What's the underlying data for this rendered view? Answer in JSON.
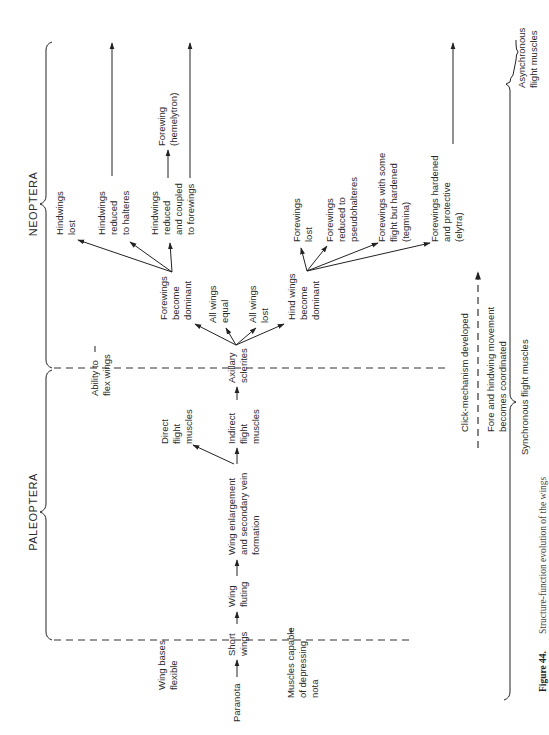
{
  "groups": {
    "neoptera": "NEOPTERA",
    "paleoptera": "PALEOPTERA",
    "synchronous": "Synchronous flight muscles",
    "asynchronous": [
      "Asynchronous",
      "flight muscles"
    ]
  },
  "thresholds": {
    "wing_bases_flexible": [
      "Wing bases",
      "flexible"
    ],
    "muscles_depressing_nota": [
      "Muscles capable",
      "of depressing",
      "nota"
    ],
    "ability_to_flex": [
      "Ability to",
      "flex wings"
    ]
  },
  "main_sequence": {
    "paranota": "Paranota",
    "short_wings": [
      "Short",
      "wings"
    ],
    "wing_fluting": [
      "Wing",
      "fluting"
    ],
    "wing_enlargement": [
      "Wing enlargement",
      "and secondary vein",
      "formation"
    ],
    "direct_flight_muscles": [
      "Direct",
      "flight",
      "muscles"
    ],
    "indirect_flight_muscles": [
      "Indirect",
      "flight",
      "muscles"
    ],
    "axillary_sclerites": [
      "Axillary",
      "sclerites"
    ]
  },
  "axillary_branches": {
    "forewings_dominant": [
      "Forewings",
      "become",
      "dominant"
    ],
    "all_wings_equal": [
      "All wings",
      "equal"
    ],
    "all_wings_lost": [
      "All wings",
      "lost"
    ],
    "hindwings_dominant": [
      "Hind wings",
      "become",
      "dominant"
    ]
  },
  "forewing_branches": {
    "hindwings_lost": [
      "Hindwings",
      "lost"
    ],
    "hindwings_halteres": [
      "Hindwings",
      "reduced",
      "to halteres"
    ],
    "hindwings_coupled": [
      "Hindwings",
      "reduced",
      "and coupled",
      "to forewings"
    ],
    "forewing_hemelytron": [
      "Forewing",
      "(hemelytron)"
    ]
  },
  "hindwing_branches": {
    "forewings_lost": [
      "Forewings",
      "lost"
    ],
    "forewings_pseudohalteres": [
      "Forewings",
      "reduced to",
      "pseudohalteres"
    ],
    "forewings_tegmina": [
      "Forewings with some",
      "flight but hardened",
      "(tegmina)"
    ],
    "forewings_elytra": [
      "Forewings hardened",
      "and protective",
      "(elytra)"
    ]
  },
  "coordination": {
    "click_mechanism": "Click-mechanism developed",
    "fore_hind": [
      "Fore and hindwing movement",
      "becomes coordinated"
    ]
  },
  "caption": {
    "label": "Figure 44.",
    "text": "Structure-function evolution of the wings"
  }
}
